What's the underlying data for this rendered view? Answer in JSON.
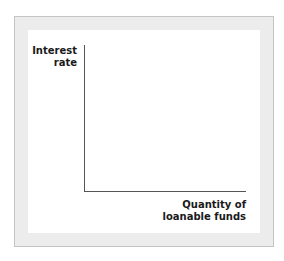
{
  "diagram": {
    "type": "empty-axes",
    "y_axis": {
      "label_lines": [
        "Interest",
        "rate"
      ]
    },
    "x_axis": {
      "label_lines": [
        "Quantity of",
        "loanable funds"
      ]
    },
    "colors": {
      "axis": "#555555",
      "frame_border": "#c4c4c4",
      "frame_fill": "#ececec",
      "panel_fill": "#ffffff",
      "text": "#1a1a1a"
    }
  }
}
